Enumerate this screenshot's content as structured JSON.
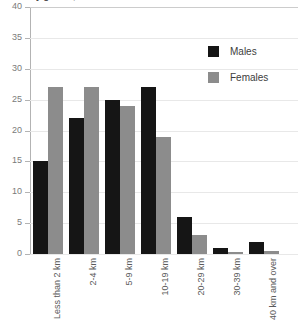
{
  "chart_data": {
    "type": "bar",
    "title": "y gender, 200",
    "xlabel": "",
    "ylabel": "",
    "ylim": [
      0,
      40
    ],
    "yticks": [
      0,
      5,
      10,
      15,
      20,
      25,
      30,
      35,
      40
    ],
    "grid": true,
    "legend_position": "top-right",
    "categories": [
      "Less than 2 km",
      "2-4 km",
      "5-9 km",
      "10-19 km",
      "20-29 km",
      "30-39 km",
      "40 km and over"
    ],
    "series": [
      {
        "name": "Males",
        "color": "#151515",
        "values": [
          15,
          22,
          25,
          27,
          6,
          1,
          2
        ]
      },
      {
        "name": "Females",
        "color": "#8c8c8c",
        "values": [
          27,
          27,
          24,
          19,
          3,
          0.4,
          0.5
        ]
      }
    ]
  },
  "colors": {
    "males": "#151515",
    "females": "#8c8c8c",
    "axis": "#b3b3b3",
    "grid": "#e8e8e8",
    "tick_text": "#7a7a7a",
    "category_text": "#5a5a5a"
  }
}
